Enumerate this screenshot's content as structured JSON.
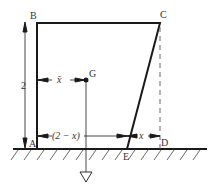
{
  "diagram": {
    "points": {
      "A": {
        "label": "A"
      },
      "B": {
        "label": "B"
      },
      "C": {
        "label": "C"
      },
      "D": {
        "label": "D"
      },
      "E": {
        "label": "E"
      },
      "G": {
        "label": "G"
      }
    },
    "dimensions": {
      "height": "2",
      "xbar": "x̄",
      "two_minus_x": "(2 − x)",
      "x": "x"
    },
    "colors": {
      "line": "#1a1a1a",
      "dashed": "#555555",
      "text": "#333333"
    }
  }
}
